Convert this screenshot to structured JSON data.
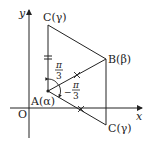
{
  "diagram": {
    "type": "complex-plane-rotation",
    "axes": {
      "x_label": "x",
      "y_label": "y",
      "origin_label": "O"
    },
    "points": {
      "A": {
        "label": "A(α)",
        "name": "A",
        "value": "α"
      },
      "B": {
        "label": "B(β)",
        "name": "B",
        "value": "β"
      },
      "C_top": {
        "label": "C(γ)",
        "name": "C",
        "value": "γ"
      },
      "C_bottom": {
        "label": "C(γ)",
        "name": "C",
        "value": "γ"
      }
    },
    "angles": {
      "upper": {
        "sign": "",
        "numerator": "π",
        "denominator": "3"
      },
      "lower": {
        "sign": "−",
        "numerator": "π",
        "denominator": "3"
      }
    },
    "colors": {
      "line": "#222222",
      "background": "#ffffff"
    }
  },
  "labels": {
    "x": "x",
    "y": "y",
    "O": "O",
    "A": "A(α)",
    "B": "B(β)",
    "C_top": "C(γ)",
    "C_bottom": "C(γ)",
    "pi": "π",
    "three": "3",
    "minus": "−"
  }
}
